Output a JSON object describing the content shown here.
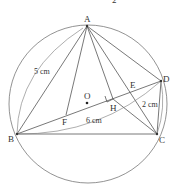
{
  "figure": {
    "top_fragment": "2",
    "colors": {
      "stroke": "#555555",
      "circle": "#777777",
      "text": "#333333",
      "background": "#ffffff"
    },
    "circle": {
      "center_label": "O",
      "cx": 88,
      "cy": 104,
      "r": 79
    },
    "points": {
      "A": {
        "label": "A",
        "x": 87,
        "y": 26
      },
      "B": {
        "label": "B",
        "x": 17,
        "y": 134
      },
      "C": {
        "label": "C",
        "x": 157,
        "y": 134
      },
      "D": {
        "label": "D",
        "x": 161,
        "y": 81
      },
      "E": {
        "label": "E",
        "x": 131,
        "y": 92
      },
      "F": {
        "label": "F",
        "x": 66,
        "y": 115
      },
      "H": {
        "label": "H",
        "x": 113,
        "y": 99
      },
      "O": {
        "label": "O",
        "x": 87,
        "y": 103
      }
    },
    "segments": [
      "AB",
      "AF",
      "AH",
      "AC",
      "AD",
      "BC",
      "BD",
      "CD",
      "HC"
    ],
    "right_angle_at": "H",
    "dimensions": [
      {
        "label": "5 cm",
        "between": "A-B"
      },
      {
        "label": "6 cm",
        "between": "B-D"
      },
      {
        "label": "2 cm",
        "between": "D-C"
      }
    ]
  }
}
